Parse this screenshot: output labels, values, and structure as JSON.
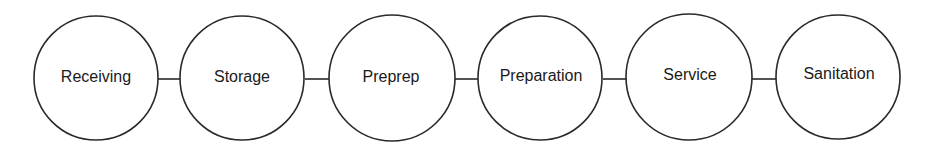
{
  "diagram": {
    "type": "linear-flow",
    "stroke_color": "#2a2a2a",
    "nodes": [
      {
        "label": "Receiving",
        "cx": 96,
        "cy": 78
      },
      {
        "label": "Storage",
        "cx": 242,
        "cy": 78
      },
      {
        "label": "Preprep",
        "cx": 392,
        "cy": 78
      },
      {
        "label": "Preparation",
        "cx": 540,
        "cy": 78
      },
      {
        "label": "Service",
        "cx": 689,
        "cy": 78
      },
      {
        "label": "Sanitation",
        "cx": 838,
        "cy": 78
      }
    ],
    "edges": [
      {
        "from": "Receiving",
        "to": "Storage"
      },
      {
        "from": "Storage",
        "to": "Preprep"
      },
      {
        "from": "Preprep",
        "to": "Preparation"
      },
      {
        "from": "Preparation",
        "to": "Service"
      },
      {
        "from": "Service",
        "to": "Sanitation"
      }
    ]
  }
}
